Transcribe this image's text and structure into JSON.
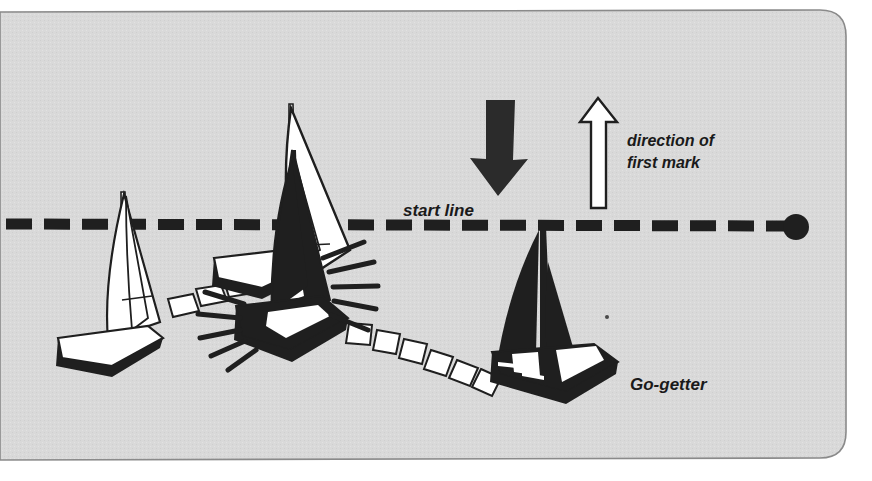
{
  "figure": {
    "background_color": "#d9d9d9",
    "ink_color": "#1f1f1f",
    "paper_color": "#ffffff",
    "frame": {
      "name": "rounded-panel",
      "corner_radius_px": 26,
      "rounded_corners": "top-right and bottom-right"
    }
  },
  "labels": {
    "start_line": "start line",
    "direction_of_first_mark": "direction of\nfirst mark",
    "direction_line_1": "direction of",
    "direction_line_2": "first mark",
    "go_getter": "Go-getter"
  },
  "markers": {
    "wind_arrow": {
      "name": "wind-direction-arrow",
      "style": "solid black",
      "points": "down"
    },
    "first_mark_arrow": {
      "name": "first-mark-direction-arrow",
      "style": "white outline",
      "points": "up"
    },
    "start_line": {
      "name": "start-line",
      "style": "dashed",
      "dash_count": 23
    },
    "committee_buoy": {
      "name": "start-line-buoy",
      "style": "filled black circle"
    }
  },
  "boats": [
    {
      "id": "boat-left-white",
      "name": "white-sailboat-left",
      "fill": "white",
      "description": "white-hulled sailboat with white sails, left of the start line"
    },
    {
      "id": "boat-center-white",
      "name": "white-sailboat-center",
      "fill": "white",
      "description": "white sailboat at the start line being struck"
    },
    {
      "id": "boat-center-black",
      "name": "black-sailboat-center",
      "fill": "black",
      "description": "black sailboat colliding at the start line"
    },
    {
      "id": "boat-go-getter",
      "name": "go-getter-sailboat",
      "fill": "black",
      "label": "Go-getter",
      "description": "black sailboat below the start line leaving a curved wake"
    }
  ],
  "wake": {
    "name": "wake-trail",
    "style": "white parallelogram dashes",
    "dash_count": 13,
    "description": "curved wake showing Go-getter's track from the collision"
  },
  "impact": {
    "name": "collision-impact-lines",
    "line_count": 10,
    "description": "radiating black lines indicating the moment of collision"
  }
}
